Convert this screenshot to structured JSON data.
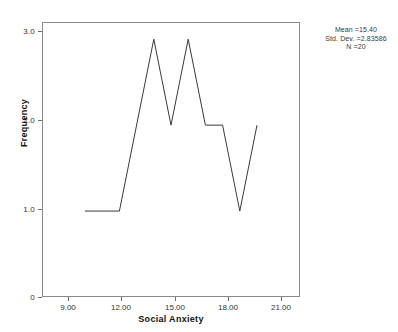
{
  "chart_data": {
    "type": "line",
    "title": "",
    "subtitle": "",
    "xlabel": "Social Anxiety",
    "ylabel": "Frequency",
    "xlim": [
      7.5,
      22.5
    ],
    "ylim": [
      0,
      3.2
    ],
    "grid": false,
    "legend_position": "none",
    "x_ticks": [
      "9.00",
      "12.00",
      "15.00",
      "18.00",
      "21.00"
    ],
    "x_tick_values": [
      9,
      12,
      15,
      18,
      21
    ],
    "y_ticks": [
      "0",
      "1.0",
      "2.0",
      "3.0"
    ],
    "y_tick_values": [
      0,
      1,
      2,
      3
    ],
    "x": [
      10,
      12,
      14,
      15,
      16,
      17,
      18,
      19,
      20
    ],
    "values": [
      1,
      1,
      3,
      2,
      3,
      2,
      2,
      1,
      2
    ],
    "series": [
      {
        "name": "Frequency",
        "color": "#3a3a3a",
        "points": [
          {
            "x": 10,
            "y": 1
          },
          {
            "x": 12,
            "y": 1
          },
          {
            "x": 14,
            "y": 3
          },
          {
            "x": 15,
            "y": 2
          },
          {
            "x": 16,
            "y": 3
          },
          {
            "x": 17,
            "y": 2
          },
          {
            "x": 18,
            "y": 2
          },
          {
            "x": 19,
            "y": 1
          },
          {
            "x": 20,
            "y": 2
          }
        ]
      }
    ],
    "annotations": {
      "mean": "Mean =15.40",
      "std_dev": "Std. Dev. =2.83586",
      "n": "N =20"
    }
  },
  "axes": {
    "y_title": "Frequency",
    "x_title": "Social Anxiety"
  },
  "stats": {
    "mean": "Mean =15.40",
    "std_dev": "Std. Dev. =2.83586",
    "n": "N =20"
  },
  "colors": {
    "line": "#3a3a3a",
    "frame": "#8b8b8b",
    "text": "#222222"
  }
}
